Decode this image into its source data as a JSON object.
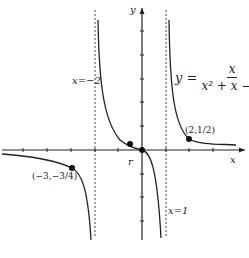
{
  "figure": {
    "type": "function graph with asymptotes",
    "equation": {
      "lhs": "y =",
      "numerator": "x",
      "denominator": "x² + x − 2"
    },
    "axes": {
      "x_label": "x",
      "y_label": "y",
      "tick_spacing": 1
    },
    "asymptotes": [
      {
        "label": "x=−2",
        "value": -2,
        "style": "dotted"
      },
      {
        "label": "x=1",
        "value": 1,
        "style": "dotted"
      }
    ],
    "points": [
      {
        "label": "(2,1/2)",
        "x": 2,
        "y": 0.5
      },
      {
        "label": "(−3,−3/4)",
        "x": -3,
        "y": -0.75
      },
      {
        "label": "r",
        "x": -0.6,
        "y": 0.2
      },
      {
        "label": "",
        "x": 0,
        "y": 0
      }
    ],
    "caption": ""
  }
}
